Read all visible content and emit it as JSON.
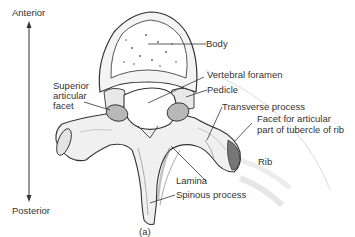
{
  "figure": {
    "caption": "(a)"
  },
  "orientation": {
    "top": "Anterior",
    "bottom": "Posterior"
  },
  "labels": {
    "body": "Body",
    "superior_articular_facet_1": "Superior",
    "superior_articular_facet_2": "articular",
    "superior_articular_facet_3": "facet",
    "vertebral_foramen": "Vertebral foramen",
    "pedicle": "Pedicle",
    "transverse_process": "Transverse process",
    "facet_tubercle_1": "Facet for articular",
    "facet_tubercle_2": "part of tubercle of rib",
    "rib": "Rib",
    "lamina": "Lamina",
    "spinous_process": "Spinous process"
  },
  "colors": {
    "line": "#333333",
    "bone_fill": "#f2f2f2",
    "facet_fill": "#b8b8b8",
    "rib": "#dddddd"
  }
}
